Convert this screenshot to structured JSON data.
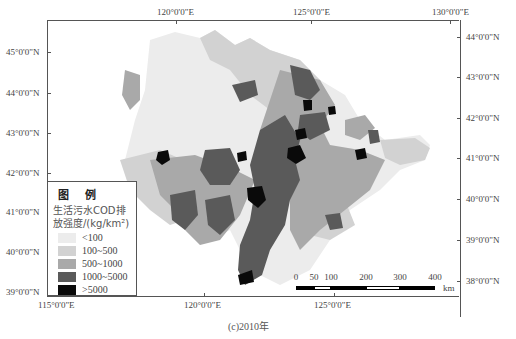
{
  "figure": {
    "caption": "(c)2010年",
    "top_axis": {
      "labels": [
        "120°0'0\"E",
        "125°0'0\"E",
        "130°0'0\"E"
      ]
    },
    "bottom_axis": {
      "labels": [
        "115°0'0\"E",
        "120°0'0\"E",
        "125°0'0\"E"
      ]
    },
    "left_axis": {
      "labels": [
        "45°0'0\"N",
        "44°0'0\"N",
        "43°0'0\"N",
        "42°0'0\"N",
        "41°0'0\"N",
        "40°0'0\"N",
        "39°0'0\"N"
      ]
    },
    "right_axis": {
      "labels": [
        "44°0'0\"N",
        "43°0'0\"N",
        "42°0'0\"N",
        "41°0'0\"N",
        "40°0'0\"N",
        "39°0'0\"N",
        "38°0'0\"N"
      ]
    }
  },
  "legend": {
    "title": "图 例",
    "subtitle_line1": "生活污水COD排",
    "subtitle_line2": "放强度/(kg/km²)",
    "items": [
      {
        "label": "<100",
        "color": "#ececec"
      },
      {
        "label": "100~500",
        "color": "#d2d2d2"
      },
      {
        "label": "500~1000",
        "color": "#a9a9a9"
      },
      {
        "label": "1000~5000",
        "color": "#5a5a5a"
      },
      {
        "label": ">5000",
        "color": "#0a0a0a"
      }
    ]
  },
  "scalebar": {
    "ticks": [
      "0",
      "50",
      "100",
      "200",
      "300",
      "400"
    ],
    "unit": "km"
  }
}
